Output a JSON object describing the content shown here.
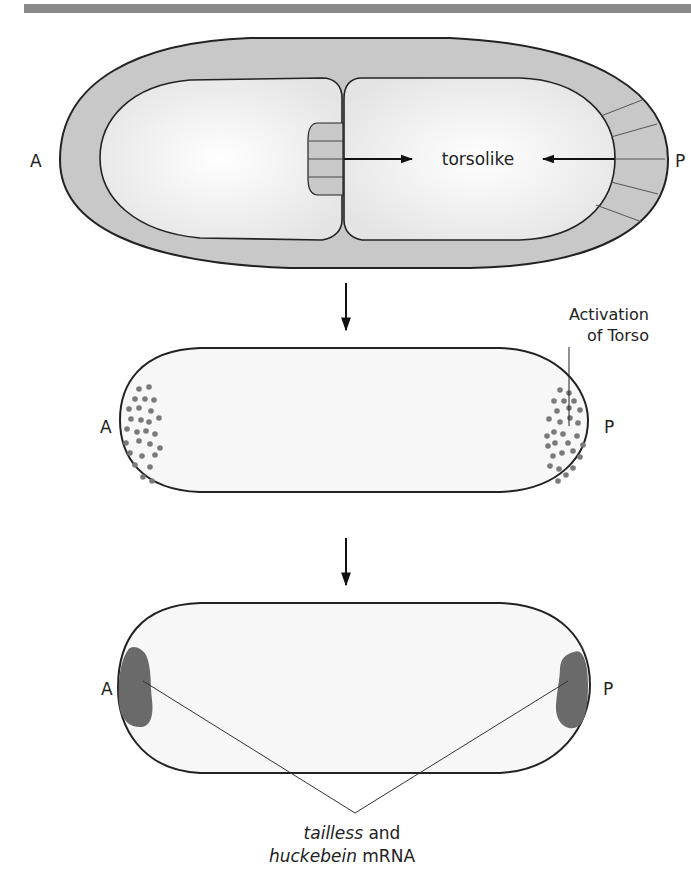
{
  "figure": {
    "header_bar_color": "#8a8a8a",
    "panel1": {
      "label_anterior": "A",
      "label_posterior": "P",
      "center_label": "torsolike",
      "colors": {
        "follicle": "#c8c8c8",
        "cytoplasm": "#f4f4f4",
        "outline": "#222222"
      }
    },
    "arrow1": "down-arrow",
    "panel2": {
      "label_anterior": "A",
      "label_posterior": "P",
      "annotation_line1": "Activation",
      "annotation_line2": "of Torso",
      "colors": {
        "dots": "#7a7a7a",
        "egg": "#f7f7f7"
      }
    },
    "arrow2": "down-arrow",
    "panel3": {
      "label_anterior": "A",
      "label_posterior": "P",
      "caption_italic1": "tailless",
      "caption_rest1": " and",
      "caption_italic2": "huckebein",
      "caption_rest2": " mRNA",
      "colors": {
        "patch": "#6a6a6a",
        "egg": "#f7f7f7"
      }
    }
  }
}
